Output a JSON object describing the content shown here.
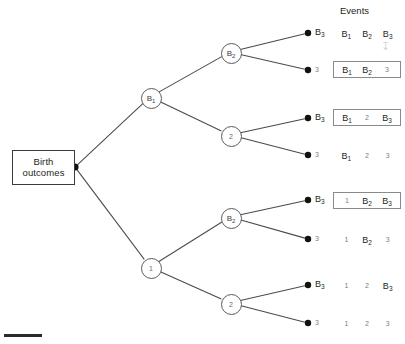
{
  "figure": {
    "events_header": "Events",
    "root": {
      "line1": "Birth",
      "line2": "outcomes"
    },
    "colors": {
      "ink": "#231f20",
      "line": "#4a4a4a",
      "node_stroke": "#5b5b5b",
      "box_stroke": "#8a8a8a",
      "muted_text": "#7d7d7d",
      "background": "#ffffff"
    },
    "nodes": [
      {
        "id": "root",
        "label": "Birth outcomes",
        "kind": "box",
        "x": 75,
        "y": 167
      },
      {
        "id": "B1",
        "label": "B",
        "sub": "1",
        "kind": "circle",
        "x": 150,
        "y": 97,
        "muted": false
      },
      {
        "id": "n1",
        "label": "1",
        "sub": "",
        "kind": "circle",
        "x": 150,
        "y": 267,
        "muted": true
      },
      {
        "id": "B2a",
        "label": "B",
        "sub": "2",
        "kind": "circle",
        "x": 230,
        "y": 52,
        "muted": false
      },
      {
        "id": "n2a",
        "label": "2",
        "sub": "",
        "kind": "circle",
        "x": 230,
        "y": 135,
        "muted": true
      },
      {
        "id": "B2b",
        "label": "B",
        "sub": "2",
        "kind": "circle",
        "x": 230,
        "y": 217,
        "muted": false
      },
      {
        "id": "n2b",
        "label": "2",
        "sub": "",
        "kind": "circle",
        "x": 230,
        "y": 303,
        "muted": true
      }
    ],
    "edges": [
      {
        "from": "root",
        "to": "B1"
      },
      {
        "from": "root",
        "to": "n1"
      },
      {
        "from": "B1",
        "to": "B2a"
      },
      {
        "from": "B1",
        "to": "n2a"
      },
      {
        "from": "n1",
        "to": "B2b"
      },
      {
        "from": "n1",
        "to": "n2b"
      },
      {
        "from": "B2a",
        "to": "L1"
      },
      {
        "from": "B2a",
        "to": "L2"
      },
      {
        "from": "n2a",
        "to": "L3"
      },
      {
        "from": "n2a",
        "to": "L4"
      },
      {
        "from": "B2b",
        "to": "L5"
      },
      {
        "from": "B2b",
        "to": "L6"
      },
      {
        "from": "n2b",
        "to": "L7"
      },
      {
        "from": "n2b",
        "to": "L8"
      }
    ],
    "leaves": [
      {
        "id": "L1",
        "x": 308,
        "y": 33,
        "label": "B",
        "sub": "3",
        "muted": false
      },
      {
        "id": "L2",
        "x": 308,
        "y": 70,
        "label": "3",
        "sub": "",
        "muted": true
      },
      {
        "id": "L3",
        "x": 308,
        "y": 118,
        "label": "B",
        "sub": "3",
        "muted": false
      },
      {
        "id": "L4",
        "x": 308,
        "y": 155,
        "label": "3",
        "sub": "",
        "muted": true
      },
      {
        "id": "L5",
        "x": 308,
        "y": 200,
        "label": "B",
        "sub": "3",
        "muted": false
      },
      {
        "id": "L6",
        "x": 308,
        "y": 239,
        "label": "3",
        "sub": "",
        "muted": true
      },
      {
        "id": "L7",
        "x": 308,
        "y": 285,
        "label": "B",
        "sub": "3",
        "muted": false
      },
      {
        "id": "L8",
        "x": 308,
        "y": 323,
        "label": "3",
        "sub": "",
        "muted": true
      }
    ],
    "event_rows": [
      {
        "id": "E1",
        "top": 25,
        "boxed": false,
        "cells": [
          {
            "label": "B",
            "sub": "1",
            "muted": false
          },
          {
            "label": "B",
            "sub": "2",
            "muted": false
          },
          {
            "label": "B",
            "sub": "3",
            "muted": false
          }
        ]
      },
      {
        "id": "E2",
        "top": 61,
        "boxed": true,
        "cells": [
          {
            "label": "B",
            "sub": "1",
            "muted": false
          },
          {
            "label": "B",
            "sub": "2",
            "muted": false
          },
          {
            "label": "3",
            "sub": "",
            "muted": true
          }
        ]
      },
      {
        "id": "E3",
        "top": 109,
        "boxed": true,
        "cells": [
          {
            "label": "B",
            "sub": "1",
            "muted": false
          },
          {
            "label": "2",
            "sub": "",
            "muted": true
          },
          {
            "label": "B",
            "sub": "3",
            "muted": false
          }
        ]
      },
      {
        "id": "E4",
        "top": 147,
        "boxed": false,
        "cells": [
          {
            "label": "B",
            "sub": "1",
            "muted": false
          },
          {
            "label": "2",
            "sub": "",
            "muted": true
          },
          {
            "label": "3",
            "sub": "",
            "muted": true
          }
        ]
      },
      {
        "id": "E5",
        "top": 192,
        "boxed": true,
        "cells": [
          {
            "label": "1",
            "sub": "",
            "muted": true
          },
          {
            "label": "B",
            "sub": "2",
            "muted": false
          },
          {
            "label": "B",
            "sub": "3",
            "muted": false
          }
        ]
      },
      {
        "id": "E6",
        "top": 231,
        "boxed": false,
        "cells": [
          {
            "label": "1",
            "sub": "",
            "muted": true
          },
          {
            "label": "B",
            "sub": "2",
            "muted": false
          },
          {
            "label": "3",
            "sub": "",
            "muted": true
          }
        ]
      },
      {
        "id": "E7",
        "top": 277,
        "boxed": false,
        "cells": [
          {
            "label": "1",
            "sub": "",
            "muted": true
          },
          {
            "label": "2",
            "sub": "",
            "muted": true
          },
          {
            "label": "B",
            "sub": "3",
            "muted": false
          }
        ]
      },
      {
        "id": "E8",
        "top": 315,
        "boxed": false,
        "cells": [
          {
            "label": "1",
            "sub": "",
            "muted": true
          },
          {
            "label": "2",
            "sub": "",
            "muted": true
          },
          {
            "label": "3",
            "sub": "",
            "muted": true
          }
        ]
      }
    ]
  }
}
